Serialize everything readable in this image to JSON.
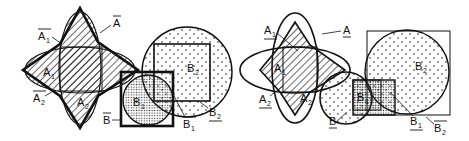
{
  "figure": {
    "left_panel": {
      "labels": {
        "A": {
          "text": "A",
          "sub": "",
          "mark": "overline"
        },
        "A1": {
          "text": "A",
          "sub": "1",
          "mark": "overline"
        },
        "A2": {
          "text": "A",
          "sub": "2",
          "mark": "overline"
        },
        "A1_region": {
          "text": "A",
          "sub": "1"
        },
        "A2_region": {
          "text": "A",
          "sub": "2"
        },
        "B": {
          "text": "B",
          "sub": "",
          "mark": "overline"
        },
        "B1": {
          "text": "B",
          "sub": "1",
          "mark": "overline"
        },
        "B2": {
          "text": "B",
          "sub": "2",
          "mark": "underline"
        },
        "B1_region": {
          "text": "B",
          "sub": "1"
        },
        "B2_region": {
          "text": "B",
          "sub": "2"
        }
      }
    },
    "right_panel": {
      "labels": {
        "A": {
          "text": "A",
          "sub": "",
          "mark": "underline"
        },
        "A1": {
          "text": "A",
          "sub": "1",
          "mark": "underline"
        },
        "A2": {
          "text": "A",
          "sub": "2",
          "mark": "underline"
        },
        "A1_region": {
          "text": "A",
          "sub": "1"
        },
        "A2_region": {
          "text": "A",
          "sub": "2"
        },
        "B": {
          "text": "B",
          "sub": "",
          "mark": "underline"
        },
        "B1": {
          "text": "B",
          "sub": "1",
          "mark": "underline"
        },
        "B2": {
          "text": "B",
          "sub": "2",
          "mark": "overline"
        },
        "B1_region": {
          "text": "B",
          "sub": "1"
        },
        "B2_region": {
          "text": "B",
          "sub": "2"
        }
      }
    },
    "colors": {
      "ink": "#111111",
      "background": "#ffffff"
    }
  }
}
